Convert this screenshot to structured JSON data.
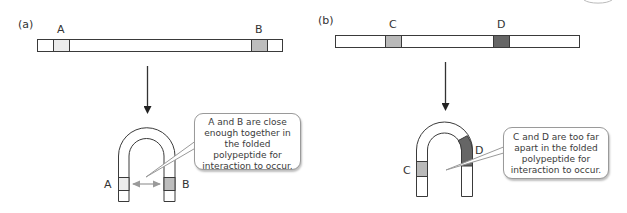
{
  "panels": [
    {
      "id": "a",
      "label": "(a)",
      "segments": [
        {
          "name": "A",
          "color": "#ececec"
        },
        {
          "name": "B",
          "color": "#bdbdbd"
        }
      ],
      "callout": "A and B are close enough together in the folded polypeptide for interaction to occur."
    },
    {
      "id": "b",
      "label": "(b)",
      "segments": [
        {
          "name": "C",
          "color": "#b9b9b9"
        },
        {
          "name": "D",
          "color": "#666666"
        }
      ],
      "callout": "C and D are too far apart in the folded polypeptide for interaction to occur."
    }
  ],
  "colors": {
    "outline": "#3a3a3a",
    "interaction_arrow": "#9a9a9a",
    "pointer": "#9a9a9a"
  }
}
